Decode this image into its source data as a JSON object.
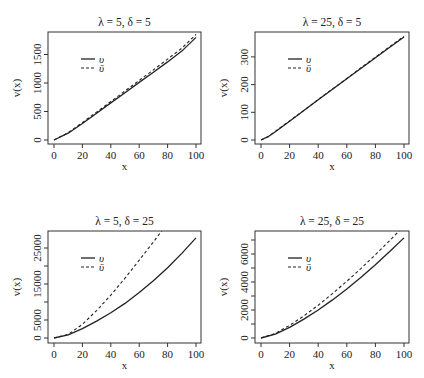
{
  "figure": {
    "legend": {
      "solid_label": "υ",
      "dashed_label": "ῡ"
    },
    "xlabel": "x",
    "ylabel": "v(x)"
  },
  "chart_data": [
    {
      "type": "line",
      "title": "λ = 5, δ = 5",
      "xlabel": "x",
      "ylabel": "v(x)",
      "xlim": [
        0,
        100
      ],
      "ylim": [
        0,
        1800
      ],
      "xticks": [
        0,
        20,
        40,
        60,
        80,
        100
      ],
      "yticks": [
        0,
        500,
        1000,
        1500
      ],
      "legend_position": "top-left",
      "grid": false,
      "x": [
        0,
        10,
        20,
        30,
        40,
        50,
        60,
        70,
        80,
        90,
        100
      ],
      "series": [
        {
          "name": "υ",
          "style": "solid",
          "values": [
            0,
            120,
            290,
            470,
            650,
            830,
            1010,
            1190,
            1370,
            1560,
            1800
          ]
        },
        {
          "name": "ῡ",
          "style": "dashed",
          "values": [
            0,
            130,
            305,
            490,
            675,
            860,
            1045,
            1230,
            1420,
            1610,
            1850
          ]
        }
      ]
    },
    {
      "type": "line",
      "title": "λ = 25, δ = 5",
      "xlabel": "x",
      "ylabel": "v(x)",
      "xlim": [
        0,
        100
      ],
      "ylim": [
        0,
        380
      ],
      "xticks": [
        0,
        20,
        40,
        60,
        80,
        100
      ],
      "yticks": [
        0,
        100,
        200,
        300
      ],
      "legend_position": "top-left",
      "grid": false,
      "x": [
        0,
        5,
        10,
        20,
        30,
        40,
        50,
        60,
        70,
        80,
        90,
        100
      ],
      "series": [
        {
          "name": "υ",
          "style": "solid",
          "values": [
            0,
            12,
            30,
            68,
            106,
            145,
            183,
            221,
            259,
            297,
            335,
            372
          ]
        },
        {
          "name": "ῡ",
          "style": "dashed",
          "values": [
            0,
            12,
            31,
            69,
            107,
            146,
            184,
            222,
            261,
            299,
            337,
            375
          ]
        }
      ]
    },
    {
      "type": "line",
      "title": "λ = 5, δ = 25",
      "xlabel": "x",
      "ylabel": "v(x)",
      "xlim": [
        0,
        100
      ],
      "ylim": [
        0,
        28000
      ],
      "xticks": [
        0,
        20,
        40,
        60,
        80,
        100
      ],
      "yticks": [
        0,
        5000,
        10000,
        15000,
        20000,
        25000
      ],
      "ytick_labels_shown": [
        "0",
        "5000",
        "15000",
        "25000"
      ],
      "legend_position": "top-left",
      "grid": false,
      "x": [
        0,
        10,
        20,
        30,
        40,
        50,
        60,
        70,
        80,
        90,
        100
      ],
      "series": [
        {
          "name": "υ",
          "style": "solid",
          "values": [
            0,
            900,
            2600,
            4700,
            7000,
            9600,
            12600,
            15900,
            19500,
            23500,
            27800
          ]
        },
        {
          "name": "ῡ",
          "style": "dashed",
          "values": [
            0,
            1000,
            3800,
            7600,
            11900,
            16600,
            21600,
            26700,
            31900,
            37200,
            42500
          ]
        }
      ]
    },
    {
      "type": "line",
      "title": "λ = 25, δ = 25",
      "xlabel": "x",
      "ylabel": "v(x)",
      "xlim": [
        0,
        100
      ],
      "ylim": [
        0,
        7200
      ],
      "xticks": [
        0,
        20,
        40,
        60,
        80,
        100
      ],
      "yticks": [
        0,
        1000,
        2000,
        3000,
        4000,
        5000,
        6000,
        7000
      ],
      "ytick_labels_shown": [
        "0",
        "2000",
        "4000",
        "6000"
      ],
      "legend_position": "top-left",
      "grid": false,
      "x": [
        0,
        10,
        20,
        30,
        40,
        50,
        60,
        70,
        80,
        90,
        100
      ],
      "series": [
        {
          "name": "υ",
          "style": "solid",
          "values": [
            0,
            280,
            760,
            1350,
            2000,
            2720,
            3500,
            4340,
            5230,
            6170,
            7150
          ]
        },
        {
          "name": "ῡ",
          "style": "dashed",
          "values": [
            0,
            320,
            900,
            1580,
            2340,
            3170,
            4050,
            4980,
            5950,
            6960,
            8000
          ]
        }
      ]
    }
  ]
}
